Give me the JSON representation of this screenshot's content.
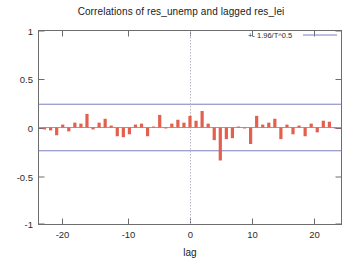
{
  "chart_data": {
    "type": "bar",
    "title": "Correlations of res_unemp and lagged res_lei",
    "xlabel": "lag",
    "ylabel": "",
    "xlim": [
      -25,
      25
    ],
    "ylim": [
      -1,
      1
    ],
    "xticks": [
      -20,
      -10,
      0,
      10,
      20
    ],
    "xtick_labels": [
      "-20",
      "-10",
      "0",
      "10",
      "20"
    ],
    "yticks": [
      -1,
      -0.5,
      0,
      0.5,
      1
    ],
    "ytick_labels": [
      "-1",
      "-0.5",
      "0",
      "0.5",
      "1"
    ],
    "grid": false,
    "legend_position": "top-right",
    "legend": [
      {
        "label": "+- 1.96/T^0.5",
        "color": "#7b7fbf",
        "type": "line"
      }
    ],
    "annotations": {
      "confidence_band_upper": 0.24,
      "confidence_band_lower": -0.24,
      "zero_line_y": 0,
      "vertical_marker_x": 0
    },
    "series_color": "#e3604f",
    "categories": [
      -24,
      -23,
      -22,
      -21,
      -20,
      -19,
      -18,
      -17,
      -16,
      -15,
      -14,
      -13,
      -12,
      -11,
      -10,
      -9,
      -8,
      -7,
      -6,
      -5,
      -4,
      -3,
      -2,
      -1,
      0,
      1,
      2,
      3,
      4,
      5,
      6,
      7,
      8,
      9,
      10,
      11,
      12,
      13,
      14,
      15,
      16,
      17,
      18,
      19,
      20,
      21,
      22,
      23,
      24
    ],
    "values": [
      -0.02,
      -0.03,
      -0.08,
      0.03,
      -0.04,
      0.05,
      0.04,
      0.14,
      -0.02,
      0.05,
      0.09,
      0.02,
      -0.09,
      -0.1,
      -0.07,
      0.03,
      0.04,
      -0.09,
      0.01,
      0.13,
      -0.01,
      0.04,
      0.08,
      0.05,
      0.12,
      0.07,
      0.17,
      0.04,
      -0.13,
      -0.34,
      -0.12,
      -0.11,
      0.01,
      -0.01,
      -0.17,
      0.12,
      0.03,
      0.05,
      0.09,
      -0.12,
      0.03,
      -0.07,
      0.02,
      -0.09,
      0.04,
      -0.05,
      0.07,
      0.06,
      -0.01
    ]
  },
  "labels": {
    "title": "Correlations of res_unemp and lagged res_lei",
    "xaxis": "lag",
    "legend_entry": "+- 1.96/T^0.5"
  }
}
